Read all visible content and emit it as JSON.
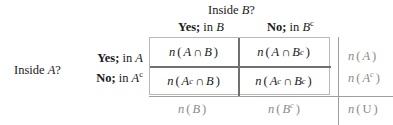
{
  "figure": {
    "type": "two-way-contingency-table",
    "title_column": {
      "prefix": "Inside ",
      "variable": "B",
      "suffix": "?",
      "full": "Inside B?"
    },
    "title_row": {
      "prefix": "Inside ",
      "variable": "A",
      "suffix": "?",
      "full": "Inside A?"
    },
    "column_headers": [
      {
        "answer": "Yes;",
        "connector": " in ",
        "set": "B",
        "complement": false,
        "full": "Yes; in B"
      },
      {
        "answer": "No;",
        "connector": " in ",
        "set": "B",
        "complement": true,
        "full": "No; in Bᶜ"
      }
    ],
    "row_headers": [
      {
        "answer": "Yes;",
        "connector": " in ",
        "set": "A",
        "complement": false,
        "full": "Yes; in A"
      },
      {
        "answer": "No;",
        "connector": " in ",
        "set": "A",
        "complement": true,
        "full": "No; in Aᶜ"
      }
    ],
    "cells": [
      {
        "id": "cell-ab",
        "left_set": "A",
        "left_complement": false,
        "right_set": "B",
        "right_complement": false,
        "full": "n(A ∩ B)"
      },
      {
        "id": "cell-abc",
        "left_set": "A",
        "left_complement": false,
        "right_set": "B",
        "right_complement": true,
        "full": "n(A ∩ Bᶜ)"
      },
      {
        "id": "cell-acb",
        "left_set": "A",
        "left_complement": true,
        "right_set": "B",
        "right_complement": false,
        "full": "n(Aᶜ ∩ B)"
      },
      {
        "id": "cell-acbc",
        "left_set": "A",
        "left_complement": true,
        "right_set": "B",
        "right_complement": true,
        "full": "n(Aᶜ ∩ Bᶜ)"
      }
    ],
    "row_totals": [
      {
        "id": "total-a",
        "set": "A",
        "complement": false,
        "full": "n(A)"
      },
      {
        "id": "total-ac",
        "set": "A",
        "complement": true,
        "full": "n(Aᶜ)"
      }
    ],
    "column_totals": [
      {
        "id": "total-b",
        "set": "B",
        "complement": false,
        "full": "n(B)"
      },
      {
        "id": "total-bc",
        "set": "B",
        "complement": true,
        "full": "n(Bᶜ)"
      }
    ],
    "grand_total": {
      "id": "total-u",
      "set": "U",
      "complement": false,
      "full": "n(U)"
    },
    "operator_symbol": "∩",
    "count_function": "n",
    "colors": {
      "text": "#1a1a1a",
      "total_text": "#8a8a8a",
      "outer_border": "#b9b9b9",
      "inner_divider": "#707070",
      "rule_line": "#9e9e9e",
      "background": "#ffffff"
    }
  }
}
